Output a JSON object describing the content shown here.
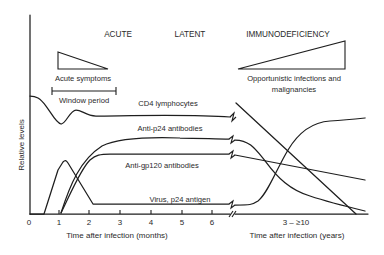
{
  "figure": {
    "phases": [
      {
        "label": "ACUTE"
      },
      {
        "label": "LATENT"
      },
      {
        "label": "IMMUNODEFICIENCY"
      }
    ],
    "annotations": {
      "acute_symptoms": "Acute symptoms",
      "window_period": "Window period",
      "opportunistic_line1": "Opportunistic infections and",
      "opportunistic_line2": "malignancies"
    },
    "y_axis_label": "Relative levels",
    "x_axis_left": {
      "title": "Time after infection (months)",
      "ticks": [
        "0",
        "1",
        "2",
        "3",
        "4",
        "5",
        "6"
      ]
    },
    "x_axis_right": {
      "title": "Time after infection (years)",
      "range_label": "3 – ≥10"
    },
    "curve_labels": {
      "cd4": "CD4 lymphocytes",
      "anti_p24": "Anti-p24 antibodies",
      "anti_gp120": "Anti-gp120 antibodies",
      "virus": "Virus, p24 antigen"
    }
  }
}
